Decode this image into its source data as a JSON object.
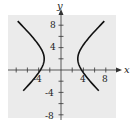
{
  "chart_data": {
    "type": "line",
    "title": "",
    "xlabel": "x",
    "ylabel": "y",
    "xlim": [
      -10,
      10
    ],
    "ylim": [
      -10,
      11
    ],
    "x_ticks": [
      -8,
      -6,
      -4,
      -2,
      2,
      4,
      6,
      8
    ],
    "y_ticks": [
      -8,
      -6,
      -4,
      -2,
      2,
      4,
      6,
      8
    ],
    "x_tick_labels": [
      "-4",
      "4",
      "8"
    ],
    "y_tick_labels": [
      "8",
      "4",
      "-4",
      "-8"
    ],
    "grid": false,
    "background": "#ebebeb",
    "curve_color": "#111111",
    "series": [
      {
        "name": "hyperbola right branch",
        "description": "x^2/9 - (y-2)^2/8 = 1, right branch",
        "x": [
          8.5,
          6.0,
          4.5,
          3.5,
          3.0,
          3.5,
          4.5,
          6.0,
          8.5
        ],
        "y": [
          9.5,
          6.9,
          5.5,
          3.5,
          2.0,
          0.5,
          -1.5,
          -2.9,
          -5.5
        ]
      },
      {
        "name": "hyperbola left branch",
        "description": "x^2/9 - (y-2)^2/8 = 1, left branch",
        "x": [
          -9.8,
          -6.0,
          -4.5,
          -3.5,
          -3.0,
          -3.5,
          -4.5,
          -6.0,
          -9.8
        ],
        "y": [
          10.0,
          6.9,
          5.5,
          3.5,
          2.0,
          0.5,
          -1.5,
          -2.9,
          -5.0
        ]
      }
    ]
  },
  "labels": {
    "x_axis": "x",
    "y_axis": "y",
    "x_neg4": "-4",
    "x_4": "4",
    "x_8": "8",
    "y_8": "8",
    "y_4": "4",
    "y_neg4": "-4",
    "y_neg8": "-8"
  }
}
